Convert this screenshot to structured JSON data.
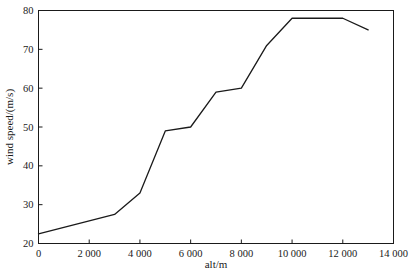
{
  "chart_data": {
    "type": "line",
    "title": "",
    "subtitle": "",
    "xlabel": "alt/m",
    "ylabel": "wind speed/(m/s)",
    "xlim": [
      0,
      14000
    ],
    "ylim": [
      20,
      80
    ],
    "xticks": [
      0,
      2000,
      4000,
      6000,
      8000,
      10000,
      12000,
      14000
    ],
    "xtick_labels": [
      "0",
      "2 000",
      "4 000",
      "6 000",
      "8 000",
      "10 000",
      "12 000",
      "14 000"
    ],
    "yticks": [
      20,
      30,
      40,
      50,
      60,
      70,
      80
    ],
    "ytick_labels": [
      "20",
      "30",
      "40",
      "50",
      "60",
      "70",
      "80"
    ],
    "grid": false,
    "legend": false,
    "legend_position": "none",
    "line_color": "#1a1a1a",
    "line_width": 1.3,
    "background_color": "#ffffff",
    "frame": true,
    "tick_direction": "in",
    "markers": false,
    "series": [
      {
        "name": "wind speed",
        "x": [
          0,
          3000,
          4000,
          5000,
          6000,
          7000,
          8000,
          9000,
          10000,
          12000,
          13000
        ],
        "values": [
          22.5,
          27.5,
          33.0,
          49.0,
          50.0,
          59.0,
          60.0,
          71.0,
          78.0,
          78.0,
          75.0
        ]
      }
    ],
    "annotations": []
  }
}
